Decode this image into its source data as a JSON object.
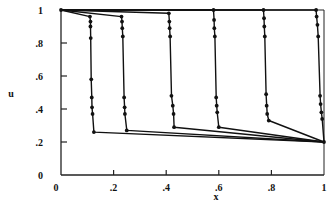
{
  "chart_data": {
    "type": "line",
    "title": "",
    "xlabel": "x",
    "ylabel": "u",
    "xlim": [
      0,
      1
    ],
    "ylim": [
      0,
      1
    ],
    "grid": false,
    "legend": null,
    "x_ticks": [
      {
        "value": 0,
        "label": "0"
      },
      {
        "value": 0.2,
        "label": ".2"
      },
      {
        "value": 0.4,
        "label": ".4"
      },
      {
        "value": 0.6,
        "label": ".6"
      },
      {
        "value": 0.8,
        "label": ".8"
      },
      {
        "value": 1,
        "label": "1"
      }
    ],
    "y_ticks": [
      {
        "value": 0,
        "label": "0"
      },
      {
        "value": 0.2,
        "label": ".2"
      },
      {
        "value": 0.4,
        "label": ".4"
      },
      {
        "value": 0.6,
        "label": ".6"
      },
      {
        "value": 0.8,
        "label": ".8"
      },
      {
        "value": 1,
        "label": "1"
      }
    ],
    "series": [
      {
        "name": "profile-1",
        "points": [
          [
            0,
            1
          ],
          [
            0.11,
            0.96
          ],
          [
            0.112,
            0.93
          ],
          [
            0.112,
            0.9
          ],
          [
            0.113,
            0.83
          ],
          [
            0.115,
            0.58
          ],
          [
            0.117,
            0.47
          ],
          [
            0.118,
            0.41
          ],
          [
            0.12,
            0.37
          ],
          [
            0.125,
            0.26
          ],
          [
            1,
            0.2
          ]
        ],
        "markers": [
          [
            0,
            1
          ],
          [
            0.11,
            0.96
          ],
          [
            0.112,
            0.93
          ],
          [
            0.112,
            0.9
          ],
          [
            0.113,
            0.83
          ],
          [
            0.115,
            0.58
          ],
          [
            0.117,
            0.47
          ],
          [
            0.118,
            0.41
          ],
          [
            0.12,
            0.37
          ],
          [
            0.125,
            0.26
          ]
        ]
      },
      {
        "name": "profile-2",
        "points": [
          [
            0,
            1
          ],
          [
            0.23,
            0.96
          ],
          [
            0.232,
            0.93
          ],
          [
            0.233,
            0.89
          ],
          [
            0.235,
            0.84
          ],
          [
            0.24,
            0.47
          ],
          [
            0.242,
            0.41
          ],
          [
            0.243,
            0.37
          ],
          [
            0.25,
            0.27
          ],
          [
            1,
            0.2
          ]
        ],
        "markers": [
          [
            0.23,
            0.96
          ],
          [
            0.232,
            0.93
          ],
          [
            0.233,
            0.89
          ],
          [
            0.235,
            0.84
          ],
          [
            0.24,
            0.47
          ],
          [
            0.242,
            0.41
          ],
          [
            0.243,
            0.37
          ],
          [
            0.25,
            0.27
          ]
        ]
      },
      {
        "name": "profile-3",
        "points": [
          [
            0,
            1
          ],
          [
            0.41,
            0.98
          ],
          [
            0.412,
            0.93
          ],
          [
            0.413,
            0.89
          ],
          [
            0.415,
            0.84
          ],
          [
            0.42,
            0.48
          ],
          [
            0.425,
            0.42
          ],
          [
            0.428,
            0.37
          ],
          [
            0.43,
            0.29
          ],
          [
            1,
            0.2
          ]
        ],
        "markers": [
          [
            0.41,
            0.98
          ],
          [
            0.412,
            0.93
          ],
          [
            0.413,
            0.89
          ],
          [
            0.415,
            0.84
          ],
          [
            0.42,
            0.48
          ],
          [
            0.425,
            0.42
          ],
          [
            0.428,
            0.37
          ],
          [
            0.43,
            0.29
          ]
        ]
      },
      {
        "name": "profile-4",
        "points": [
          [
            0,
            1
          ],
          [
            0.58,
            1.0
          ],
          [
            0.582,
            0.94
          ],
          [
            0.583,
            0.89
          ],
          [
            0.585,
            0.84
          ],
          [
            0.59,
            0.47
          ],
          [
            0.592,
            0.42
          ],
          [
            0.594,
            0.38
          ],
          [
            0.6,
            0.29
          ],
          [
            1,
            0.2
          ]
        ],
        "markers": [
          [
            0.58,
            1.0
          ],
          [
            0.582,
            0.94
          ],
          [
            0.583,
            0.89
          ],
          [
            0.585,
            0.84
          ],
          [
            0.59,
            0.47
          ],
          [
            0.592,
            0.42
          ],
          [
            0.594,
            0.38
          ],
          [
            0.6,
            0.29
          ]
        ]
      },
      {
        "name": "profile-5",
        "points": [
          [
            0,
            1
          ],
          [
            0.77,
            1.0
          ],
          [
            0.772,
            0.95
          ],
          [
            0.773,
            0.9
          ],
          [
            0.775,
            0.84
          ],
          [
            0.78,
            0.49
          ],
          [
            0.782,
            0.42
          ],
          [
            0.784,
            0.37
          ],
          [
            0.79,
            0.33
          ],
          [
            1,
            0.2
          ]
        ],
        "markers": [
          [
            0.77,
            1.0
          ],
          [
            0.772,
            0.95
          ],
          [
            0.773,
            0.9
          ],
          [
            0.775,
            0.84
          ],
          [
            0.78,
            0.49
          ],
          [
            0.782,
            0.42
          ],
          [
            0.784,
            0.37
          ],
          [
            0.79,
            0.33
          ]
        ]
      },
      {
        "name": "profile-6",
        "points": [
          [
            0,
            1
          ],
          [
            0.97,
            1.0
          ],
          [
            0.972,
            0.96
          ],
          [
            0.975,
            0.91
          ],
          [
            0.978,
            0.84
          ],
          [
            0.985,
            0.48
          ],
          [
            0.987,
            0.43
          ],
          [
            0.99,
            0.38
          ],
          [
            0.993,
            0.34
          ],
          [
            1,
            0.2
          ]
        ],
        "markers": [
          [
            0.97,
            1.0
          ],
          [
            0.972,
            0.96
          ],
          [
            0.975,
            0.91
          ],
          [
            0.978,
            0.84
          ],
          [
            0.985,
            0.48
          ],
          [
            0.987,
            0.43
          ],
          [
            0.99,
            0.38
          ],
          [
            0.993,
            0.34
          ],
          [
            1,
            0.2
          ]
        ]
      }
    ],
    "colors": {
      "line": "#111111",
      "marker": "#111111",
      "axis": "#222222"
    }
  }
}
